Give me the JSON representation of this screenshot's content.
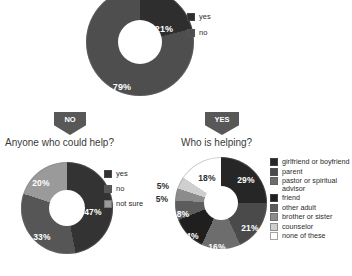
{
  "page": {
    "background": "#ffffff",
    "text_color": "#2b2b2b"
  },
  "chart_data": [
    {
      "id": "top-donut",
      "type": "pie",
      "variant": "donut",
      "title": "",
      "categories": [
        "yes",
        "no"
      ],
      "values": [
        21,
        79
      ],
      "labels": [
        "21%",
        "79%"
      ],
      "colors": [
        "#2e2e2e",
        "#4e4e4e"
      ],
      "legend_position": "right",
      "legend": [
        "yes",
        "no"
      ]
    },
    {
      "id": "left-donut",
      "type": "pie",
      "variant": "donut",
      "title": "Anyone who could help?",
      "categories": [
        "yes",
        "no",
        "not sure"
      ],
      "values": [
        47,
        33,
        20
      ],
      "labels": [
        "47%",
        "33%",
        "20%"
      ],
      "colors": [
        "#333333",
        "#565656",
        "#9a9a9a"
      ],
      "legend_position": "right",
      "legend": [
        "yes",
        "no",
        "not sure"
      ]
    },
    {
      "id": "right-donut",
      "type": "pie",
      "variant": "donut",
      "title": "Who is helping?",
      "categories": [
        "girlfriend or boyfriend",
        "parent",
        "pastor or spiritual advisor",
        "friend",
        "other adult",
        "brother or sister",
        "counselor",
        "none of these"
      ],
      "values": [
        29,
        21,
        16,
        14,
        8,
        5,
        5,
        18
      ],
      "labels": [
        "29%",
        "21%",
        "16%",
        "14%",
        "8%",
        "5%",
        "5%",
        "18%"
      ],
      "colors": [
        "#262626",
        "#4a4a4a",
        "#6d6d6d",
        "#1f1f1f",
        "#5c5c5c",
        "#8c8c8c",
        "#cfcfcf",
        "#ffffff"
      ],
      "legend_position": "right",
      "legend": [
        "girlfriend or boyfriend",
        "parent",
        "pastor or spiritual advisor",
        "friend",
        "other adult",
        "brother or sister",
        "counselor",
        "none of these"
      ]
    }
  ],
  "top_chart": {
    "legend": [
      {
        "label": "yes",
        "color": "#2e2e2e"
      },
      {
        "label": "no",
        "color": "#4e4e4e"
      }
    ],
    "slices": [
      {
        "label": "21%"
      },
      {
        "label": "79%"
      }
    ]
  },
  "left_section": {
    "badge": "NO",
    "heading": "Anyone who could help?",
    "legend": [
      {
        "label": "yes",
        "color": "#333333"
      },
      {
        "label": "no",
        "color": "#565656"
      },
      {
        "label": "not sure",
        "color": "#9a9a9a"
      }
    ],
    "slices": [
      {
        "label": "47%"
      },
      {
        "label": "33%"
      },
      {
        "label": "20%"
      }
    ]
  },
  "right_section": {
    "badge": "YES",
    "heading": "Who is helping?",
    "legend": [
      {
        "label": "girlfriend or boyfriend",
        "color": "#262626"
      },
      {
        "label": "parent",
        "color": "#4a4a4a"
      },
      {
        "label": "pastor or spiritual advisor",
        "color": "#6d6d6d"
      },
      {
        "label": "friend",
        "color": "#1f1f1f"
      },
      {
        "label": "other adult",
        "color": "#5c5c5c"
      },
      {
        "label": "brother or sister",
        "color": "#8c8c8c"
      },
      {
        "label": "counselor",
        "color": "#cfcfcf"
      },
      {
        "label": "none of these",
        "color": "#ffffff"
      }
    ],
    "slices": [
      {
        "label": "29%"
      },
      {
        "label": "21%"
      },
      {
        "label": "16%"
      },
      {
        "label": "14%"
      },
      {
        "label": "8%"
      },
      {
        "label": "5%"
      },
      {
        "label": "5%"
      },
      {
        "label": "18%"
      }
    ]
  }
}
